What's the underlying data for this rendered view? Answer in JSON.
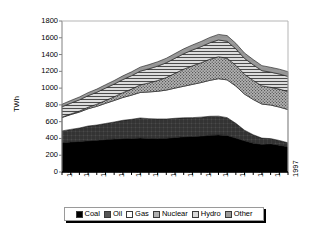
{
  "chart_data": {
    "type": "area",
    "stacked": true,
    "title": "",
    "xlabel": "",
    "ylabel": "TWh",
    "ylim": [
      0,
      1800
    ],
    "ytick_step": 200,
    "yticks": [
      0,
      200,
      400,
      600,
      800,
      1000,
      1200,
      1400,
      1600,
      1800
    ],
    "grid": false,
    "legend_position": "bottom",
    "x": [
      1971,
      1972,
      1973,
      1974,
      1975,
      1976,
      1977,
      1978,
      1979,
      1980,
      1981,
      1982,
      1983,
      1984,
      1985,
      1986,
      1987,
      1988,
      1989,
      1990,
      1991,
      1992,
      1993,
      1994,
      1995,
      1996,
      1997
    ],
    "xtick_labels": [
      "1971",
      "1973",
      "1975",
      "1977",
      "1979",
      "1981",
      "1983",
      "1985",
      "1987",
      "1989",
      "1991",
      "1993",
      "1995",
      "1997"
    ],
    "series": [
      {
        "name": "Coal",
        "color": "#000000",
        "pattern": "solid",
        "values": [
          350,
          358,
          364,
          372,
          378,
          386,
          392,
          398,
          400,
          404,
          400,
          398,
          402,
          412,
          420,
          424,
          428,
          438,
          442,
          436,
          404,
          372,
          344,
          330,
          336,
          320,
          300
        ]
      },
      {
        "name": "Oil",
        "color": "#404040",
        "pattern": "cross-hatch",
        "values": [
          140,
          150,
          160,
          176,
          182,
          192,
          204,
          218,
          228,
          240,
          236,
          234,
          230,
          228,
          226,
          224,
          226,
          226,
          224,
          212,
          176,
          126,
          100,
          74,
          62,
          56,
          48
        ]
      },
      {
        "name": "Gas",
        "color": "#ffffff",
        "pattern": "solid",
        "values": [
          160,
          176,
          190,
          206,
          222,
          240,
          256,
          272,
          288,
          304,
          318,
          330,
          344,
          360,
          376,
          396,
          412,
          428,
          446,
          450,
          444,
          430,
          420,
          406,
          400,
          398,
          396
        ]
      },
      {
        "name": "Nuclear",
        "color": "#a8a8a8",
        "pattern": "dense-dots",
        "values": [
          4,
          8,
          12,
          18,
          26,
          34,
          44,
          58,
          72,
          90,
          108,
          128,
          150,
          176,
          204,
          222,
          236,
          252,
          262,
          258,
          248,
          236,
          228,
          216,
          212,
          214,
          216
        ]
      },
      {
        "name": "Hydro",
        "color": "#c0c0c0",
        "pattern": "horizontal-lines",
        "values": [
          124,
          128,
          134,
          138,
          142,
          148,
          152,
          156,
          160,
          164,
          168,
          172,
          176,
          180,
          184,
          188,
          192,
          196,
          200,
          202,
          196,
          190,
          186,
          182,
          180,
          180,
          180
        ]
      },
      {
        "name": "Other",
        "color": "#909090",
        "pattern": "solid-gray",
        "values": [
          30,
          32,
          34,
          36,
          38,
          40,
          42,
          44,
          46,
          48,
          50,
          52,
          54,
          56,
          58,
          60,
          62,
          64,
          66,
          68,
          66,
          64,
          62,
          60,
          58,
          58,
          56
        ]
      }
    ],
    "totals_note": "Stacked totals peak near 1700 TWh around 1989-1990"
  },
  "axis": {
    "y_label": "TWh",
    "y_ticks": [
      "0",
      "200",
      "400",
      "600",
      "800",
      "1000",
      "1200",
      "1400",
      "1600",
      "1800"
    ],
    "x_ticks": [
      "1971",
      "1973",
      "1975",
      "1977",
      "1979",
      "1981",
      "1983",
      "1985",
      "1987",
      "1989",
      "1991",
      "1993",
      "1995",
      "1997"
    ]
  },
  "legend": {
    "items": [
      {
        "label": "Coal"
      },
      {
        "label": "Oil"
      },
      {
        "label": "Gas"
      },
      {
        "label": "Nuclear"
      },
      {
        "label": "Hydro"
      },
      {
        "label": "Other"
      }
    ]
  }
}
